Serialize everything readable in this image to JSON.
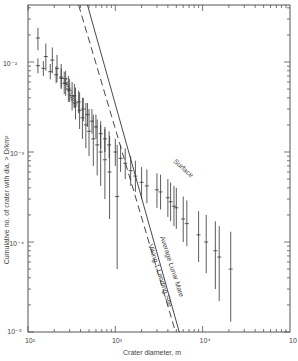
{
  "chart_data": {
    "type": "scatter",
    "title": "",
    "xlabel": "Crater diameter, m",
    "ylabel": "Cumulative no. of crater with dia. > D/km²",
    "xscale": "log",
    "yscale": "log",
    "xlim": [
      100,
      100000
    ],
    "ylim": [
      1e-05,
      0.043
    ],
    "x_ticks": [
      "10²",
      "10³",
      "10⁴",
      "10⁵"
    ],
    "y_ticks": [
      "10⁻²",
      "10⁻³",
      "10⁻⁴",
      "10⁻⁵"
    ],
    "grid": false,
    "series": [
      {
        "name": "Surface",
        "kind": "points_with_errorbars",
        "points": [
          {
            "x": 130,
            "y": 0.0185,
            "lo": 0.0135,
            "hi": 0.024
          },
          {
            "x": 160,
            "y": 0.0115,
            "lo": 0.008,
            "hi": 0.016
          },
          {
            "x": 190,
            "y": 0.0105,
            "lo": 0.0075,
            "hi": 0.0145
          },
          {
            "x": 215,
            "y": 0.0085,
            "lo": 0.006,
            "hi": 0.012
          },
          {
            "x": 240,
            "y": 0.0068,
            "lo": 0.005,
            "hi": 0.0095
          },
          {
            "x": 270,
            "y": 0.0058,
            "lo": 0.0042,
            "hi": 0.008
          },
          {
            "x": 300,
            "y": 0.0048,
            "lo": 0.0036,
            "hi": 0.0065
          },
          {
            "x": 340,
            "y": 0.0042,
            "lo": 0.0031,
            "hi": 0.0057
          },
          {
            "x": 380,
            "y": 0.0036,
            "lo": 0.0027,
            "hi": 0.0048
          },
          {
            "x": 430,
            "y": 0.003,
            "lo": 0.0022,
            "hi": 0.004
          },
          {
            "x": 480,
            "y": 0.0026,
            "lo": 0.0019,
            "hi": 0.0035
          },
          {
            "x": 540,
            "y": 0.0022,
            "lo": 0.0016,
            "hi": 0.003
          },
          {
            "x": 600,
            "y": 0.0019,
            "lo": 0.0014,
            "hi": 0.0026
          },
          {
            "x": 680,
            "y": 0.0016,
            "lo": 0.0011,
            "hi": 0.0022
          },
          {
            "x": 760,
            "y": 0.0014,
            "lo": 0.001,
            "hi": 0.0019
          },
          {
            "x": 850,
            "y": 0.0012,
            "lo": 0.00085,
            "hi": 0.0017
          },
          {
            "x": 1000,
            "y": 0.001,
            "lo": 0.0007,
            "hi": 0.0014
          },
          {
            "x": 1150,
            "y": 0.00085,
            "lo": 0.0006,
            "hi": 0.0012
          },
          {
            "x": 1300,
            "y": 0.00075,
            "lo": 0.0005,
            "hi": 0.0011
          },
          {
            "x": 1500,
            "y": 0.00062,
            "lo": 0.00042,
            "hi": 0.0009
          },
          {
            "x": 1700,
            "y": 0.00054,
            "lo": 0.00036,
            "hi": 0.0008
          },
          {
            "x": 2000,
            "y": 0.00046,
            "lo": 0.0003,
            "hi": 0.00068
          },
          {
            "x": 2300,
            "y": 0.00042,
            "lo": 0.00027,
            "hi": 0.00064
          },
          {
            "x": 3000,
            "y": 0.00038,
            "lo": 0.00024,
            "hi": 0.00058
          },
          {
            "x": 3300,
            "y": 0.00036,
            "lo": 0.00023,
            "hi": 0.00056
          },
          {
            "x": 4000,
            "y": 0.00031,
            "lo": 0.00019,
            "hi": 0.0005
          },
          {
            "x": 4300,
            "y": 0.00028,
            "lo": 0.00017,
            "hi": 0.00046
          },
          {
            "x": 4700,
            "y": 0.00025,
            "lo": 0.00015,
            "hi": 0.00042
          },
          {
            "x": 5000,
            "y": 0.00024,
            "lo": 0.00014,
            "hi": 0.0004
          },
          {
            "x": 6000,
            "y": 0.00018,
            "lo": 0.0001,
            "hi": 0.00032
          },
          {
            "x": 6600,
            "y": 0.00016,
            "lo": 9e-05,
            "hi": 0.00029
          },
          {
            "x": 9000,
            "y": 0.00012,
            "lo": 6e-05,
            "hi": 0.00022
          },
          {
            "x": 11000,
            "y": 0.0001,
            "lo": 4.5e-05,
            "hi": 0.0002
          },
          {
            "x": 14000,
            "y": 8e-05,
            "lo": 3e-05,
            "hi": 0.00017
          },
          {
            "x": 15500,
            "y": 6.8e-05,
            "lo": 2.2e-05,
            "hi": 0.00015
          },
          {
            "x": 21000,
            "y": 5e-05,
            "lo": 1.3e-05,
            "hi": 0.00013
          }
        ]
      },
      {
        "name": "Ares Vallis",
        "kind": "points_with_errorbars",
        "points": [
          {
            "x": 130,
            "y": 0.0091,
            "lo": 0.0075,
            "hi": 0.011
          },
          {
            "x": 150,
            "y": 0.0085,
            "lo": 0.007,
            "hi": 0.0102
          },
          {
            "x": 180,
            "y": 0.0078,
            "lo": 0.0064,
            "hi": 0.0095
          },
          {
            "x": 210,
            "y": 0.0072,
            "lo": 0.0058,
            "hi": 0.009
          },
          {
            "x": 240,
            "y": 0.0066,
            "lo": 0.0052,
            "hi": 0.0085
          },
          {
            "x": 260,
            "y": 0.0058,
            "lo": 0.0044,
            "hi": 0.0078
          },
          {
            "x": 290,
            "y": 0.005,
            "lo": 0.0036,
            "hi": 0.007
          },
          {
            "x": 320,
            "y": 0.0042,
            "lo": 0.0029,
            "hi": 0.006
          },
          {
            "x": 350,
            "y": 0.0035,
            "lo": 0.0023,
            "hi": 0.0052
          },
          {
            "x": 390,
            "y": 0.0029,
            "lo": 0.0018,
            "hi": 0.0046
          },
          {
            "x": 420,
            "y": 0.0024,
            "lo": 0.0014,
            "hi": 0.004
          },
          {
            "x": 460,
            "y": 0.002,
            "lo": 0.0011,
            "hi": 0.0035
          },
          {
            "x": 500,
            "y": 0.0017,
            "lo": 0.0009,
            "hi": 0.003
          },
          {
            "x": 560,
            "y": 0.0014,
            "lo": 0.0007,
            "hi": 0.0026
          },
          {
            "x": 620,
            "y": 0.0012,
            "lo": 0.00055,
            "hi": 0.0023
          },
          {
            "x": 680,
            "y": 0.001,
            "lo": 0.00042,
            "hi": 0.002
          },
          {
            "x": 760,
            "y": 0.00082,
            "lo": 0.0003,
            "hi": 0.0018
          },
          {
            "x": 860,
            "y": 0.0006,
            "lo": 0.00018,
            "hi": 0.0015
          },
          {
            "x": 1050,
            "y": 0.00032,
            "lo": 5e-05,
            "hi": 0.0012
          }
        ]
      },
      {
        "name": "Average Lunar Mare",
        "kind": "line",
        "style": "solid",
        "x": [
          480,
          5400
        ],
        "y": [
          0.043,
          1e-05
        ]
      },
      {
        "name": "Viking 1 Landing Site",
        "kind": "line",
        "style": "dashed",
        "x": [
          380,
          4900
        ],
        "y": [
          0.043,
          1e-05
        ]
      }
    ],
    "annotations": [
      "Ares Vallis",
      "Surface",
      "Average Lunar Mare",
      "Viking 1 Landing Site"
    ],
    "legend": "none (inline labels)"
  },
  "labels": {
    "xlabel": "Crater diameter, m",
    "ylabel": "Cumulative no. of crater with dia. > D/km²",
    "x2": "10²",
    "x3": "10³",
    "x4": "10⁴",
    "x5": "10",
    "y2": "10⁻²",
    "y3": "10⁻³",
    "y4": "10⁻⁴",
    "y5": "10⁻⁵",
    "ares": "Ares Vallis",
    "surface": "Surface",
    "mare": "Average Lunar Mare",
    "viking": "Viking 1 Landing Site"
  }
}
